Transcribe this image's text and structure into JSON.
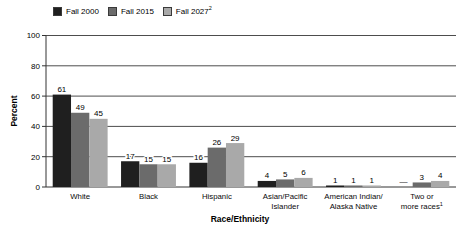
{
  "figure": {
    "background": "#ffffff"
  },
  "chart_data": {
    "type": "bar",
    "title": "",
    "ylabel": "Percent",
    "xlabel": "Race/Ethnicity",
    "ylim": [
      0,
      100
    ],
    "yticks": [
      0,
      20,
      40,
      60,
      80,
      100
    ],
    "grid": true,
    "legend_position": "top-left",
    "missing_value_marker": "—",
    "categories": [
      {
        "lines": [
          "White"
        ],
        "sup": ""
      },
      {
        "lines": [
          "Black"
        ],
        "sup": ""
      },
      {
        "lines": [
          "Hispanic"
        ],
        "sup": ""
      },
      {
        "lines": [
          "Asian/Pacific",
          "Islander"
        ],
        "sup": ""
      },
      {
        "lines": [
          "American Indian/",
          "Alaska Native"
        ],
        "sup": ""
      },
      {
        "lines": [
          "Two or",
          "more races"
        ],
        "sup": "1"
      }
    ],
    "series": [
      {
        "name": "Fall 2000",
        "sup": "",
        "color": "#1f1f1f",
        "values": [
          61,
          17,
          16,
          4,
          1,
          null
        ]
      },
      {
        "name": "Fall 2015",
        "sup": "",
        "color": "#6b6b6b",
        "values": [
          49,
          15,
          26,
          5,
          1,
          3
        ]
      },
      {
        "name": "Fall 2027",
        "sup": "2",
        "color": "#a9a9a9",
        "values": [
          45,
          15,
          29,
          6,
          1,
          4
        ]
      }
    ],
    "style": {
      "grid_color": "#4d4d4d",
      "axis_color": "#333333",
      "text_color": "#000000"
    }
  }
}
